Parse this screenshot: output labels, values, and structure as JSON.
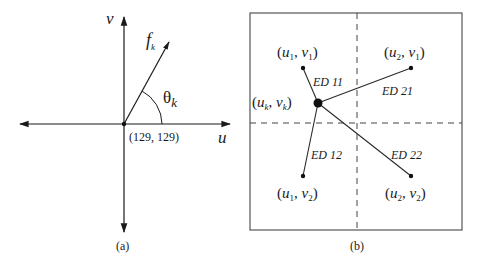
{
  "panel_a": {
    "caption": "(a)",
    "axis_u_label": "u",
    "axis_v_label": "v",
    "vector_label": "f",
    "vector_label_sub": "k",
    "angle_label": "θ",
    "angle_label_sub": "k",
    "origin_label": "(129, 129)"
  },
  "panel_b": {
    "caption": "(b)",
    "center_label": {
      "u": "u",
      "u_sub": "k",
      "sep": ", ",
      "v": "v",
      "v_sub": "k"
    },
    "points": [
      {
        "id": "p11",
        "u": "u",
        "u_sub": "1",
        "v": "v",
        "v_sub": "1",
        "distance_label": "ED 11"
      },
      {
        "id": "p21",
        "u": "u",
        "u_sub": "2",
        "v": "v",
        "v_sub": "1",
        "distance_label": "ED 21"
      },
      {
        "id": "p12",
        "u": "u",
        "u_sub": "1",
        "v": "v",
        "v_sub": "2",
        "distance_label": "ED 12"
      },
      {
        "id": "p22",
        "u": "u",
        "u_sub": "2",
        "v": "v",
        "v_sub": "2",
        "distance_label": "ED 22"
      }
    ]
  },
  "colors": {
    "stroke": "#2a2a2a",
    "box": "#555555",
    "dash": "#444444"
  }
}
